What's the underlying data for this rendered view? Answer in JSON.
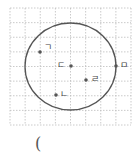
{
  "diagram": {
    "type": "circle-on-grid",
    "grid": {
      "cols": 8,
      "rows": 8,
      "x0": 10,
      "y0": 8,
      "x1": 131,
      "y1": 125,
      "line_color": "#bdbdbd",
      "style": "dotted"
    },
    "circle": {
      "cx": 70.5,
      "cy": 66.5,
      "rx": 45.5,
      "ry": 43.5,
      "stroke": "#555555"
    },
    "points": [
      {
        "label": "ㄱ",
        "x": 40,
        "y": 52,
        "label_x": 44,
        "label_y": 43
      },
      {
        "label": "ㄴ",
        "x": 56,
        "y": 95,
        "label_x": 60,
        "label_y": 90
      },
      {
        "label": "ㄷ",
        "x": 71,
        "y": 66,
        "label_x": 57,
        "label_y": 61
      },
      {
        "label": "ㄹ",
        "x": 86,
        "y": 80,
        "label_x": 91,
        "label_y": 75
      },
      {
        "label": "ㅁ",
        "x": 116,
        "y": 66,
        "label_x": 120,
        "label_y": 61
      }
    ]
  },
  "answer_blank": {
    "text": "("
  }
}
